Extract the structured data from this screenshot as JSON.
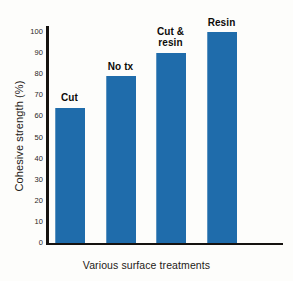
{
  "chart_data": {
    "type": "bar",
    "title": "",
    "subtitle": "",
    "categories": [
      "Cut",
      "No tx",
      "Cut &\nresin",
      "Resin"
    ],
    "values": [
      64,
      79,
      90,
      100
    ],
    "xlabel": "Various surface treatments",
    "ylabel": "Cohesive strength (%)",
    "ylim": [
      0,
      100
    ],
    "yticks": [
      0,
      10,
      20,
      30,
      40,
      50,
      60,
      70,
      80,
      90,
      100
    ],
    "ytick_labels": [
      "0",
      "10",
      "20",
      "30",
      "40",
      "50",
      "60",
      "70",
      "80",
      "90",
      "100"
    ],
    "grid": false,
    "legend": false,
    "legend_position": "none",
    "bar_color": "#1f6cab",
    "axis_color": "#15120f",
    "background_color": "#fdfdfb",
    "data_labels_above_bars": true
  }
}
